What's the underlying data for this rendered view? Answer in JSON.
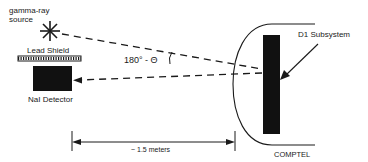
{
  "diagram": {
    "labels": {
      "source": [
        "gamma-ray",
        "source"
      ],
      "shield": "Lead Shield",
      "detector": "NaI Detector",
      "angle": "180° - Θ",
      "subsystem": "D1 Subsystem",
      "distance": "~ 1.5 meters",
      "instrument": "COMPTEL"
    },
    "colors": {
      "ink": "#1a1a1a",
      "background": "#ffffff"
    }
  }
}
